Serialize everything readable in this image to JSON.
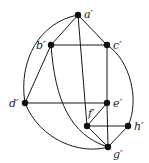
{
  "nodes": [
    {
      "id": "a",
      "label": "a′",
      "x": 78,
      "y": 15,
      "lx": 84,
      "ly": 18
    },
    {
      "id": "b",
      "label": "b′",
      "x": 51,
      "y": 45,
      "lx": 36,
      "ly": 49
    },
    {
      "id": "c",
      "label": "c′",
      "x": 107,
      "y": 45,
      "lx": 113,
      "ly": 49
    },
    {
      "id": "d",
      "label": "d′",
      "x": 25,
      "y": 103,
      "lx": 9,
      "ly": 107
    },
    {
      "id": "e",
      "label": "e′",
      "x": 107,
      "y": 103,
      "lx": 113,
      "ly": 107
    },
    {
      "id": "f",
      "label": "f′",
      "x": 87,
      "y": 126,
      "lx": 88,
      "ly": 117
    },
    {
      "id": "h",
      "label": "h′",
      "x": 128,
      "y": 126,
      "lx": 134,
      "ly": 130
    },
    {
      "id": "g",
      "label": "g′",
      "x": 108,
      "y": 147,
      "lx": 113,
      "ly": 158
    }
  ],
  "edges": [
    {
      "from": "a",
      "to": "b",
      "type": "line"
    },
    {
      "from": "a",
      "to": "c",
      "type": "line"
    },
    {
      "from": "b",
      "to": "c",
      "type": "line"
    },
    {
      "from": "a",
      "to": "f",
      "type": "line"
    },
    {
      "from": "a",
      "to": "d",
      "type": "arc",
      "path": "M78,15 C40,22 18,60 25,103"
    },
    {
      "from": "b",
      "to": "d",
      "type": "line"
    },
    {
      "from": "b",
      "to": "g",
      "type": "arc",
      "path": "M51,45 C55,100 70,135 108,147"
    },
    {
      "from": "c",
      "to": "e",
      "type": "line"
    },
    {
      "from": "c",
      "to": "h",
      "type": "arc",
      "path": "M107,45 C130,60 140,100 128,126"
    },
    {
      "from": "d",
      "to": "e",
      "type": "line"
    },
    {
      "from": "d",
      "to": "g",
      "type": "arc",
      "path": "M25,103 C40,140 80,155 108,147"
    },
    {
      "from": "e",
      "to": "f",
      "type": "line"
    },
    {
      "from": "e",
      "to": "g",
      "type": "line"
    },
    {
      "from": "f",
      "to": "h",
      "type": "line"
    },
    {
      "from": "f",
      "to": "g",
      "type": "line"
    },
    {
      "from": "h",
      "to": "g",
      "type": "line"
    }
  ]
}
